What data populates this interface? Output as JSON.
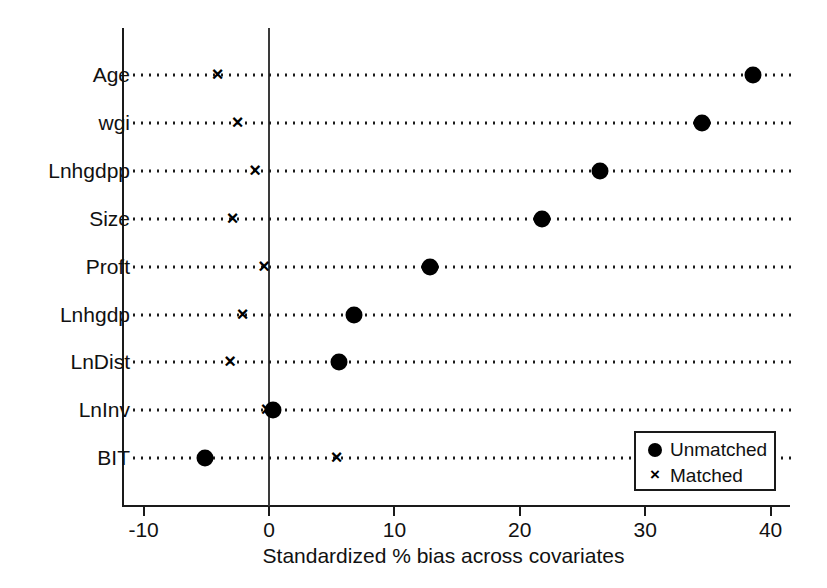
{
  "chart_data": {
    "type": "scatter",
    "title": "",
    "xlabel": "Standardized % bias across covariates",
    "ylabel": "",
    "xlim": [
      -13,
      41.5
    ],
    "xticks": [
      -10,
      0,
      10,
      20,
      30,
      40
    ],
    "xticklabels": [
      "-10",
      "0",
      "10",
      "20",
      "30",
      "40"
    ],
    "grid": "dotted-horizontal-per-category",
    "reference_line_x": 0,
    "legend_position": "bottom-right",
    "categories": [
      "Age",
      "wgi",
      "Lnhgdpp",
      "Size",
      "Proft",
      "Lnhgdp",
      "LnDist",
      "LnInv",
      "BIT"
    ],
    "series": [
      {
        "name": "Unmatched",
        "marker": "filled-circle",
        "values": [
          38.6,
          34.5,
          26.4,
          21.8,
          12.8,
          6.8,
          5.6,
          0.3,
          -5.1
        ]
      },
      {
        "name": "Matched",
        "marker": "cross",
        "values": [
          -4.1,
          -2.5,
          -1.1,
          -2.9,
          -0.4,
          -2.1,
          -3.1,
          -0.2,
          5.4
        ]
      }
    ]
  },
  "legend": {
    "entries": [
      {
        "label": "Unmatched",
        "symbol": "filled-circle-icon"
      },
      {
        "label": "Matched",
        "symbol": "cross-icon"
      }
    ]
  }
}
